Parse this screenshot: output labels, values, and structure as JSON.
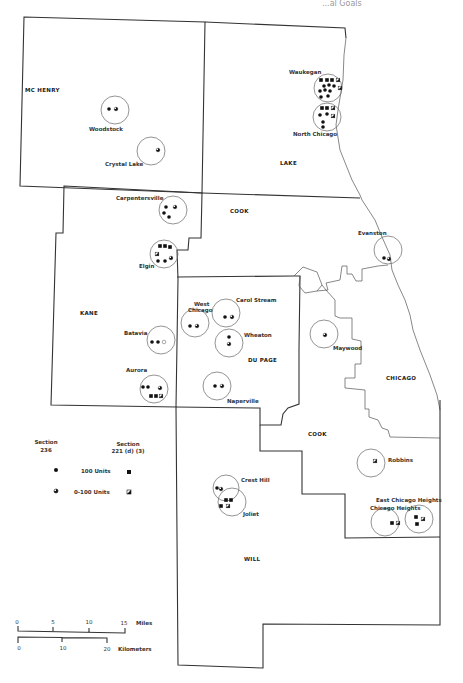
{
  "header": {
    "fragment": "...al Goals"
  },
  "counties": [
    {
      "name": "MC HENRY",
      "x": 25,
      "y": 92
    },
    {
      "name": "LAKE",
      "x": 280,
      "y": 165
    },
    {
      "name": "COOK",
      "x": 230,
      "y": 213
    },
    {
      "name": "KANE",
      "x": 80,
      "y": 315
    },
    {
      "name": "DU PAGE",
      "x": 248,
      "y": 362
    },
    {
      "name": "COOK",
      "x": 308,
      "y": 436
    },
    {
      "name": "CHICAGO",
      "x": 386,
      "y": 380
    },
    {
      "name": "WILL",
      "x": 244,
      "y": 561
    }
  ],
  "cities": [
    {
      "name": "Woodstock",
      "label_x": 89,
      "label_y": 131,
      "cx": 115,
      "cy": 110,
      "r": 14,
      "symbols": [
        {
          "t": "dot",
          "x": 109,
          "y": 109
        },
        {
          "t": "dotp",
          "x": 116,
          "y": 109
        }
      ]
    },
    {
      "name": "Crystal Lake",
      "label_x": 105,
      "label_y": 166,
      "cx": 151,
      "cy": 151,
      "r": 14,
      "symbols": [
        {
          "t": "dotp",
          "x": 158,
          "y": 150
        }
      ]
    },
    {
      "name": "Waukegan",
      "label_x": 289,
      "label_y": 74,
      "cx": 328,
      "cy": 88,
      "r": 14,
      "symbols": [
        {
          "t": "sq",
          "x": 321,
          "y": 80
        },
        {
          "t": "sq",
          "x": 327,
          "y": 80
        },
        {
          "t": "sq",
          "x": 332,
          "y": 80
        },
        {
          "t": "sqp",
          "x": 338,
          "y": 80
        },
        {
          "t": "dot",
          "x": 324,
          "y": 86
        },
        {
          "t": "dot",
          "x": 329,
          "y": 85
        },
        {
          "t": "dot",
          "x": 334,
          "y": 86
        },
        {
          "t": "sqp",
          "x": 340,
          "y": 88
        },
        {
          "t": "dot",
          "x": 320,
          "y": 91
        },
        {
          "t": "dot",
          "x": 325,
          "y": 90
        },
        {
          "t": "dot",
          "x": 330,
          "y": 91
        },
        {
          "t": "dot",
          "x": 321,
          "y": 97
        },
        {
          "t": "dot",
          "x": 328,
          "y": 96
        }
      ]
    },
    {
      "name": "North Chicago",
      "label_x": 293,
      "label_y": 136,
      "cx": 327,
      "cy": 117,
      "r": 14,
      "symbols": [
        {
          "t": "sq",
          "x": 322,
          "y": 108
        },
        {
          "t": "sq",
          "x": 327,
          "y": 108
        },
        {
          "t": "sqp",
          "x": 333,
          "y": 108
        },
        {
          "t": "dot",
          "x": 320,
          "y": 115
        },
        {
          "t": "dot",
          "x": 327,
          "y": 114
        },
        {
          "t": "sqp",
          "x": 333,
          "y": 116
        },
        {
          "t": "dot",
          "x": 323,
          "y": 122
        },
        {
          "t": "dot",
          "x": 323,
          "y": 127
        }
      ]
    },
    {
      "name": "Carpentersville",
      "label_x": 116,
      "label_y": 200,
      "cx": 173,
      "cy": 210,
      "r": 14,
      "symbols": [
        {
          "t": "dot",
          "x": 166,
          "y": 207
        },
        {
          "t": "dotp",
          "x": 175,
          "y": 207
        },
        {
          "t": "dot",
          "x": 164,
          "y": 213
        },
        {
          "t": "dot",
          "x": 169,
          "y": 217
        }
      ]
    },
    {
      "name": "Elgin",
      "label_x": 139,
      "label_y": 268,
      "cx": 164,
      "cy": 254,
      "r": 14,
      "symbols": [
        {
          "t": "sq",
          "x": 160,
          "y": 246
        },
        {
          "t": "sq",
          "x": 165,
          "y": 246
        },
        {
          "t": "sq",
          "x": 170,
          "y": 247
        },
        {
          "t": "sqp",
          "x": 157,
          "y": 254
        },
        {
          "t": "dot",
          "x": 158,
          "y": 261
        },
        {
          "t": "dot",
          "x": 165,
          "y": 261
        },
        {
          "t": "dotp",
          "x": 171,
          "y": 258
        }
      ]
    },
    {
      "name": "West Chicago",
      "label_x": 188,
      "label_y": 306,
      "cx": 195,
      "cy": 323,
      "r": 14,
      "symbols": [
        {
          "t": "dot",
          "x": 190,
          "y": 326
        },
        {
          "t": "dotp",
          "x": 197,
          "y": 326
        }
      ]
    },
    {
      "name": "Carol Stream",
      "label_x": 236,
      "label_y": 302,
      "cx": 226,
      "cy": 313,
      "r": 14,
      "symbols": [
        {
          "t": "dot",
          "x": 225,
          "y": 317
        },
        {
          "t": "dotp",
          "x": 232,
          "y": 317
        }
      ]
    },
    {
      "name": "Wheaton",
      "label_x": 244,
      "label_y": 337,
      "cx": 229,
      "cy": 343,
      "r": 14,
      "symbols": [
        {
          "t": "dot",
          "x": 229,
          "y": 337
        },
        {
          "t": "dotp",
          "x": 229,
          "y": 344
        }
      ]
    },
    {
      "name": "Batavia",
      "label_x": 124,
      "label_y": 335,
      "cx": 161,
      "cy": 340,
      "r": 14,
      "symbols": [
        {
          "t": "dot",
          "x": 152,
          "y": 342
        },
        {
          "t": "dot",
          "x": 158,
          "y": 342
        },
        {
          "t": "dotp0",
          "x": 164,
          "y": 342
        }
      ]
    },
    {
      "name": "Aurora",
      "label_x": 126,
      "label_y": 372,
      "cx": 154,
      "cy": 389,
      "r": 14,
      "symbols": [
        {
          "t": "dot",
          "x": 143,
          "y": 387
        },
        {
          "t": "dot",
          "x": 148,
          "y": 387
        },
        {
          "t": "dotp",
          "x": 160,
          "y": 388
        },
        {
          "t": "sq",
          "x": 151,
          "y": 396
        },
        {
          "t": "sq",
          "x": 156,
          "y": 396
        },
        {
          "t": "sqp",
          "x": 161,
          "y": 396
        }
      ]
    },
    {
      "name": "Naperville",
      "label_x": 227,
      "label_y": 403,
      "cx": 217,
      "cy": 386,
      "r": 14,
      "symbols": [
        {
          "t": "dot",
          "x": 215,
          "y": 386
        },
        {
          "t": "dotp",
          "x": 222,
          "y": 386
        }
      ]
    },
    {
      "name": "Evanston",
      "label_x": 358,
      "label_y": 235,
      "cx": 388,
      "cy": 250,
      "r": 14,
      "symbols": [
        {
          "t": "dot",
          "x": 384,
          "y": 258
        },
        {
          "t": "dotp",
          "x": 389,
          "y": 259
        }
      ]
    },
    {
      "name": "Maywood",
      "label_x": 333,
      "label_y": 350,
      "cx": 324,
      "cy": 334,
      "r": 14,
      "symbols": [
        {
          "t": "dotp",
          "x": 325,
          "y": 335
        }
      ]
    },
    {
      "name": "Robbins",
      "label_x": 388,
      "label_y": 462,
      "cx": 371,
      "cy": 463,
      "r": 14,
      "symbols": [
        {
          "t": "sqp",
          "x": 375,
          "y": 461
        }
      ]
    },
    {
      "name": "Crest Hill",
      "label_x": 241,
      "label_y": 482,
      "cx": 226,
      "cy": 488,
      "r": 13,
      "symbols": [
        {
          "t": "dot",
          "x": 217,
          "y": 488
        },
        {
          "t": "dotp",
          "x": 221,
          "y": 489
        }
      ]
    },
    {
      "name": "Joliet",
      "label_x": 243,
      "label_y": 516,
      "cx": 232,
      "cy": 502,
      "r": 14,
      "symbols": [
        {
          "t": "sq",
          "x": 226,
          "y": 500
        },
        {
          "t": "sq",
          "x": 231,
          "y": 500
        },
        {
          "t": "sq",
          "x": 221,
          "y": 506
        },
        {
          "t": "sqp",
          "x": 228,
          "y": 506
        }
      ]
    },
    {
      "name": "Chicago Heights",
      "label_x": 370,
      "label_y": 510,
      "cx": 385,
      "cy": 522,
      "r": 14,
      "symbols": [
        {
          "t": "sq",
          "x": 392,
          "y": 523
        },
        {
          "t": "sqp",
          "x": 398,
          "y": 523
        }
      ]
    },
    {
      "name": "East Chicago Heights",
      "label_x": 376,
      "label_y": 502,
      "cx": 419,
      "cy": 519,
      "r": 14,
      "symbols": [
        {
          "t": "sq",
          "x": 416,
          "y": 517
        },
        {
          "t": "sqp",
          "x": 423,
          "y": 519
        },
        {
          "t": "sq",
          "x": 417,
          "y": 524
        }
      ]
    }
  ],
  "legend": {
    "col1_title_1": "Section",
    "col1_title_2": "236",
    "col2_title_1": "Section",
    "col2_title_2": "221 (d) (3)",
    "row1_label": "100 Units",
    "row2_label": "0-100 Units"
  },
  "scale": {
    "miles_label": "Miles",
    "miles_ticks": [
      "0",
      "5",
      "10",
      "15"
    ],
    "km_label": "Kilometers",
    "km_ticks": [
      "0",
      "10",
      "20"
    ]
  }
}
